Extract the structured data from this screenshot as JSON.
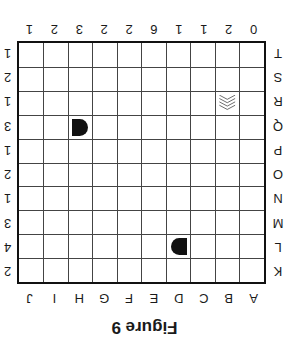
{
  "figure": {
    "caption": "Figure 9",
    "column_labels": [
      "A",
      "B",
      "C",
      "D",
      "E",
      "F",
      "G",
      "H",
      "I",
      "J"
    ],
    "column_clues": [
      "0",
      "2",
      "1",
      "1",
      "6",
      "2",
      "2",
      "3",
      "2",
      "1"
    ],
    "row_labels": [
      "K",
      "L",
      "M",
      "N",
      "O",
      "P",
      "Q",
      "R",
      "S",
      "T"
    ],
    "row_clues": [
      "2",
      "4",
      "3",
      "1",
      "2",
      "1",
      "3",
      "1",
      "2",
      "1"
    ],
    "orientation": "rotated 180 degrees",
    "pieces": [
      {
        "type": "rounded-end-left",
        "column": "H",
        "row": "Q",
        "color": "#111111"
      },
      {
        "type": "hatched-chevron",
        "column": "B",
        "row": "R",
        "color": "#555555"
      },
      {
        "type": "rounded-end-right",
        "column": "D",
        "row": "L",
        "color": "#111111"
      }
    ],
    "colors": {
      "grid": "#111111",
      "background": "#ffffff",
      "text": "#1a1a1a"
    }
  }
}
